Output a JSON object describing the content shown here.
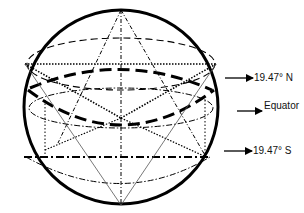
{
  "diagram": {
    "type": "sphere-latitude-diagram",
    "colors": {
      "stroke": "#000000",
      "thin_stroke": "#555555",
      "text": "#111111",
      "background": "#ffffff"
    },
    "sphere": {
      "cx": 121,
      "cy": 107,
      "r": 97
    },
    "labels": {
      "north": "19.47° N",
      "equator": "Equator",
      "south": "19.47° S"
    },
    "latitude_lines": [
      {
        "name": "north-19.47",
        "style": "dotted",
        "y": 64
      },
      {
        "name": "equator",
        "style": "thick-dashed",
        "y": 108
      },
      {
        "name": "south-19.47",
        "style": "dash-dot",
        "y": 157
      }
    ]
  }
}
